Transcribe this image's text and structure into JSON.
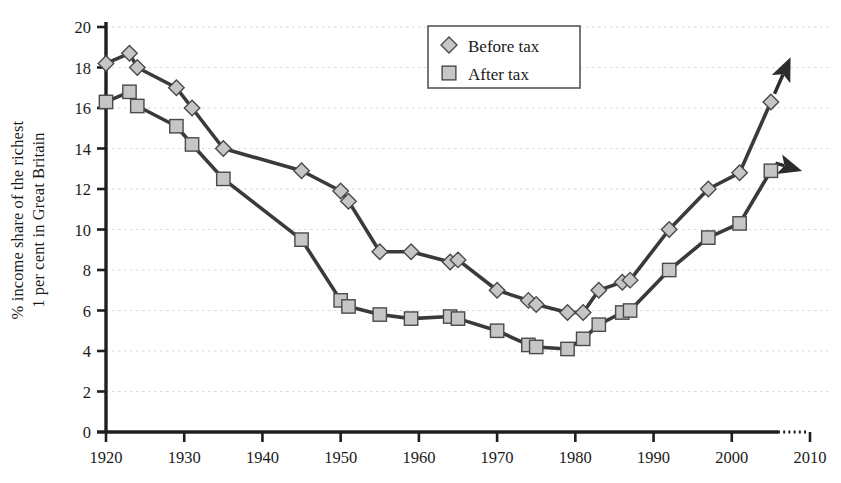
{
  "chart_data": {
    "type": "line",
    "title": "",
    "subtitle": "",
    "xlabel": "",
    "ylabel": "% income share of the richest 1 per cent in Great Britain",
    "ylabel_lines": [
      "% income share of the richest",
      "1 per cent in Great Britain"
    ],
    "xlim": [
      1920,
      2010
    ],
    "ylim": [
      0,
      20
    ],
    "xticks": [
      1920,
      1930,
      1940,
      1950,
      1960,
      1970,
      1980,
      1990,
      2000,
      2010
    ],
    "xtick_labels": [
      "1920",
      "1930",
      "1940",
      "1950",
      "1960",
      "1970",
      "1980",
      "1990",
      "2000",
      "2010"
    ],
    "yticks": [
      0,
      2,
      4,
      6,
      8,
      10,
      12,
      14,
      16,
      18,
      20
    ],
    "ytick_labels": [
      "0",
      "2",
      "4",
      "6",
      "8",
      "10",
      "12",
      "14",
      "16",
      "18",
      "20"
    ],
    "grid": "horizontal-dotted",
    "legend_position": "top-center",
    "axis_extension_dotted": true,
    "arrow_endings": true,
    "series": [
      {
        "name": "Before tax",
        "marker": "diamond",
        "color": "#3a3a3a",
        "marker_fill": "#c8c8c8",
        "x": [
          1920,
          1923,
          1924,
          1929,
          1931,
          1935,
          1945,
          1950,
          1951,
          1955,
          1959,
          1964,
          1965,
          1970,
          1974,
          1975,
          1979,
          1981,
          1983,
          1986,
          1987,
          1992,
          1997,
          2001,
          2005
        ],
        "values": [
          18.2,
          18.7,
          18.0,
          17.0,
          16.0,
          14.0,
          12.9,
          11.9,
          11.4,
          8.9,
          8.9,
          8.4,
          8.5,
          7.0,
          6.5,
          6.3,
          5.9,
          5.9,
          7.0,
          7.4,
          7.5,
          10.0,
          12.0,
          12.8,
          16.3
        ]
      },
      {
        "name": "After tax",
        "marker": "square",
        "color": "#3a3a3a",
        "marker_fill": "#c8c8c8",
        "x": [
          1920,
          1923,
          1924,
          1929,
          1931,
          1935,
          1945,
          1950,
          1951,
          1955,
          1959,
          1964,
          1965,
          1970,
          1974,
          1975,
          1979,
          1981,
          1983,
          1986,
          1987,
          1992,
          1997,
          2001,
          2005
        ],
        "values": [
          16.3,
          16.8,
          16.1,
          15.1,
          14.2,
          12.5,
          9.5,
          6.5,
          6.2,
          5.8,
          5.6,
          5.7,
          5.6,
          5.0,
          4.3,
          4.2,
          4.1,
          4.6,
          5.3,
          5.9,
          6.0,
          8.0,
          9.6,
          10.3,
          12.9
        ]
      }
    ],
    "legend": [
      {
        "label": "Before tax",
        "marker": "diamond"
      },
      {
        "label": "After tax",
        "marker": "square"
      }
    ]
  },
  "colors": {
    "line": "#3a3a3a",
    "marker_fill": "#c6c6c6",
    "marker_stroke": "#4a4a4a",
    "axis": "#1f1f1f",
    "grid": "#d9d9e0",
    "text": "#1a1a1a",
    "background": "#ffffff"
  }
}
